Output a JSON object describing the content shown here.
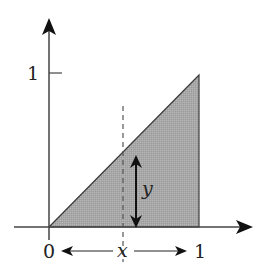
{
  "diagram": {
    "title": "",
    "axes": {
      "y_tick_label": "1",
      "x_origin_label": "0",
      "x_end_label": "1"
    },
    "labels": {
      "x_variable": "x",
      "y_variable": "y"
    },
    "region": {
      "shape": "triangle",
      "vertices": [
        [
          0,
          0
        ],
        [
          1,
          1
        ],
        [
          1,
          0
        ]
      ],
      "fill": "#a9a9a9",
      "stroke": "#333333"
    },
    "dashed_line": {
      "at_x": "x"
    },
    "colors": {
      "axis": "#333333",
      "fill": "#a9a9a9",
      "text": "#222222"
    }
  }
}
